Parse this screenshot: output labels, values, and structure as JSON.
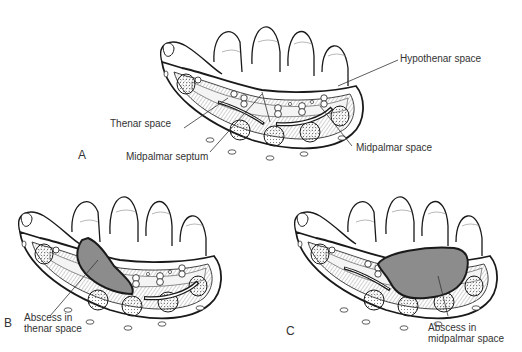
{
  "figure": {
    "panels": [
      {
        "id": "A",
        "letter": "A",
        "labels": {
          "hypothenar": "Hypothenar space",
          "thenar": "Thenar space",
          "septum": "Midpalmar septum",
          "midpalmar": "Midpalmar space"
        }
      },
      {
        "id": "B",
        "letter": "B",
        "labels": {
          "abscess_line1": "Abscess in",
          "abscess_line2": "thenar space"
        }
      },
      {
        "id": "C",
        "letter": "C",
        "labels": {
          "abscess_line1": "Abscess in",
          "abscess_line2": "midpalmar space"
        }
      }
    ],
    "colors": {
      "line": "#1a1a1a",
      "abscess_fill": "#8c8c8c",
      "muscle_fill": "#d8d8d8",
      "background": "#ffffff"
    }
  }
}
